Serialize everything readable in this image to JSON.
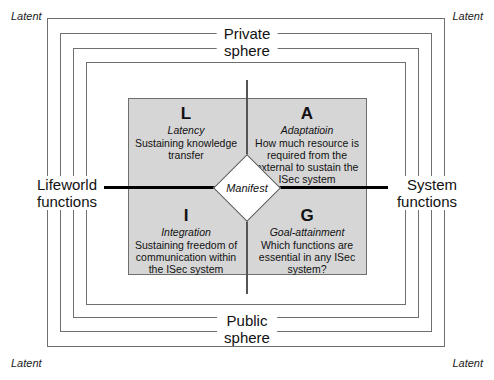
{
  "diagram": {
    "corner_labels": {
      "top_left": "Latent",
      "top_right": "Latent",
      "bottom_left": "Latent",
      "bottom_right": "Latent"
    },
    "axes": {
      "top": {
        "line1": "Private",
        "line2": "sphere"
      },
      "bottom": {
        "line1": "Public",
        "line2": "sphere"
      },
      "left": {
        "line1": "Lifeworld",
        "line2": "functions"
      },
      "right": {
        "line1": "System",
        "line2": "functions"
      }
    },
    "center": {
      "label": "Manifest"
    },
    "quadrants": [
      {
        "id": "L",
        "position": "top-left",
        "letter": "L",
        "name": "Latency",
        "description": "Sustaining knowledge transfer"
      },
      {
        "id": "A",
        "position": "top-right",
        "letter": "A",
        "name": "Adaptatioin",
        "description": "How much resource is required from the external to sustain the ISec system"
      },
      {
        "id": "I",
        "position": "bottom-left",
        "letter": "I",
        "name": "Integration",
        "description": "Sustaining freedom of communication within the ISec system"
      },
      {
        "id": "G",
        "position": "bottom-right",
        "letter": "G",
        "name": "Goal-attainment",
        "description": "Which functions are essential in any ISec system?"
      }
    ],
    "frames": {
      "count": 4
    },
    "colors": {
      "quadrant_fill": "#d6d6d6",
      "frame_stroke": "#6f6f6f",
      "axis_horizontal": "#000000",
      "axis_vertical": "#555555",
      "diamond_fill": "#ffffff",
      "text": "#111111"
    }
  }
}
